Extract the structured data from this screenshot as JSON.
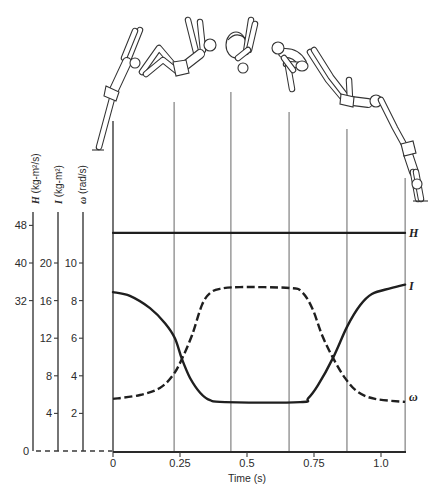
{
  "chart_data": {
    "type": "line",
    "title": "",
    "xlabel": "Time (s)",
    "xlim": [
      0,
      1.09
    ],
    "x_ticks": [
      0,
      0.25,
      0.5,
      0.75,
      1.0
    ],
    "x_tick_labels": [
      "0",
      "0.25",
      "0.5",
      "0.75",
      "1.0"
    ],
    "zero_label": "0",
    "grid": false,
    "legend": "inline labels at right end of each curve",
    "y_axes": [
      {
        "name": "H",
        "symbol": "H",
        "units": "(kg-m²/s)",
        "ticks": [
          32,
          40,
          48
        ],
        "tick_labels": [
          "32",
          "40",
          "48"
        ],
        "ylim": [
          0,
          48
        ]
      },
      {
        "name": "I",
        "symbol": "I",
        "units": "(kg-m²)",
        "ticks": [
          4,
          8,
          12,
          16,
          20
        ],
        "tick_labels": [
          "4",
          "8",
          "12",
          "16",
          "20"
        ],
        "ylim": [
          0,
          20
        ]
      },
      {
        "name": "ω",
        "symbol": "ω",
        "units": "(rad/s)",
        "ticks": [
          2,
          4,
          6,
          8,
          10
        ],
        "tick_labels": [
          "2",
          "4",
          "6",
          "8",
          "10"
        ],
        "ylim": [
          0,
          10
        ]
      }
    ],
    "series": [
      {
        "name": "H",
        "label": "H",
        "axis": "H",
        "style": "solid",
        "x": [
          0,
          1.09
        ],
        "values": [
          46.4,
          46.4
        ]
      },
      {
        "name": "I",
        "label": "I",
        "axis": "I",
        "style": "solid",
        "x": [
          0,
          0.063,
          0.138,
          0.194,
          0.231,
          0.257,
          0.287,
          0.325,
          0.362,
          0.418,
          0.698,
          0.728,
          0.765,
          0.821,
          0.873,
          0.922,
          0.966,
          1.034,
          1.09
        ],
        "values": [
          16.9,
          16.5,
          15.2,
          13.6,
          12.0,
          9.8,
          7.8,
          6.2,
          5.4,
          5.2,
          5.2,
          5.6,
          7.0,
          9.9,
          13.2,
          15.5,
          16.7,
          17.3,
          17.7
        ]
      },
      {
        "name": "ω",
        "label": "ω",
        "axis": "ω",
        "style": "dashed",
        "x": [
          0,
          0.101,
          0.175,
          0.224,
          0.257,
          0.295,
          0.332,
          0.362,
          0.399,
          0.474,
          0.66,
          0.705,
          0.743,
          0.78,
          0.821,
          0.866,
          0.914,
          0.978,
          1.09
        ],
        "values": [
          2.77,
          2.98,
          3.35,
          4.04,
          4.89,
          6.17,
          7.77,
          8.4,
          8.62,
          8.72,
          8.67,
          8.46,
          7.61,
          6.17,
          4.95,
          3.88,
          3.14,
          2.77,
          2.61
        ]
      }
    ],
    "phase_markers_s": [
      0,
      0.228,
      0.44,
      0.657,
      0.873,
      1.09
    ],
    "illustration": "diver silhouettes at each phase marker: takeoff, layout, tuck (inverted), tuck, opening, water entry"
  }
}
